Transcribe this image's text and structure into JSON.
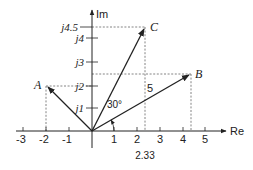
{
  "diagram": {
    "type": "complex-plane phasor diagram",
    "axes": {
      "x_label": "Re",
      "y_label": "Im",
      "x_ticks": [
        "-3",
        "-2",
        "-1",
        "1",
        "2",
        "3",
        "4",
        "5"
      ],
      "x_tick_values": [
        -3,
        -2,
        -1,
        1,
        2,
        3,
        4,
        5
      ],
      "y_ticks": [
        "j1",
        "j2",
        "j3",
        "j4",
        "j4.5"
      ],
      "y_tick_values": [
        1,
        2,
        3,
        4,
        4.5
      ],
      "x_annotation": "2.33"
    },
    "points": [
      {
        "name": "A",
        "label": "A",
        "re": -2,
        "im": 2
      },
      {
        "name": "B",
        "label": "B",
        "re": 4.33,
        "im": 2.5
      },
      {
        "name": "C",
        "label": "C",
        "re": 2.33,
        "im": 4.5
      }
    ],
    "annotations": {
      "angle": "30°",
      "magnitude": "5"
    },
    "colors": {
      "line": "#222222",
      "dashed": "#666666",
      "background": "#ffffff"
    }
  }
}
